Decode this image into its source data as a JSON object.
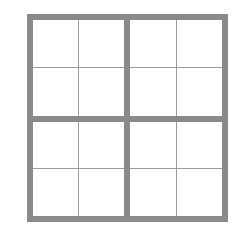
{
  "grid": {
    "rows": 4,
    "cols": 4,
    "blocks": {
      "rows": 2,
      "cols": 2
    },
    "cells": [
      [
        "",
        "",
        "",
        ""
      ],
      [
        "",
        "",
        "",
        ""
      ],
      [
        "",
        "",
        "",
        ""
      ],
      [
        "",
        "",
        "",
        ""
      ]
    ]
  },
  "colors": {
    "thick_line": "#8a8a8a",
    "thin_line": "#9a9a9a",
    "background": "#ffffff"
  }
}
